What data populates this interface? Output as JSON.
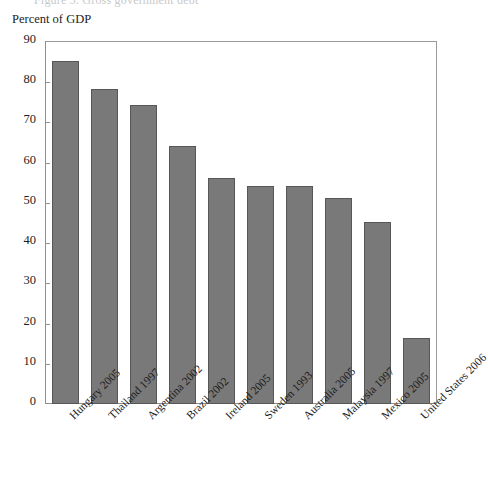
{
  "figure": {
    "clipped_title": "Figure 3. Gross government debt",
    "axis_label": "Percent of GDP"
  },
  "chart_data": {
    "type": "bar",
    "title": "",
    "xlabel": "",
    "ylabel": "Percent of GDP",
    "ylim": [
      0,
      90
    ],
    "ytick_values": [
      0,
      10,
      20,
      30,
      40,
      50,
      60,
      70,
      80,
      90
    ],
    "ytick_labels": [
      "0",
      "10",
      "20",
      "30",
      "40",
      "50",
      "60",
      "70",
      "80",
      "90"
    ],
    "grid": false,
    "legend": null,
    "bar_color": "#797979",
    "bar_edge_color": "#575757",
    "categories": [
      "Hungary 2005",
      "Thailand 1997",
      "Argentina 2002",
      "Brazil 2002",
      "Ireland 2005",
      "Sweden 1993",
      "Australia 2005",
      "Malaysia 1997",
      "Mexico 2005",
      "United States 2006"
    ],
    "values": [
      85.4,
      78.2,
      74.4,
      64.2,
      56.2,
      54.2,
      54.2,
      51.2,
      45.2,
      16.3
    ]
  }
}
